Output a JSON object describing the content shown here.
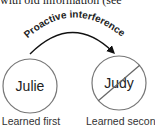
{
  "top_text": "with old information (see",
  "diagram": {
    "arc_label": "Proactive interference",
    "left_circle": {
      "name": "Julie",
      "caption": "Learned first"
    },
    "right_circle": {
      "name": "Judy",
      "caption": "Learned second",
      "crossed_out": true
    }
  }
}
